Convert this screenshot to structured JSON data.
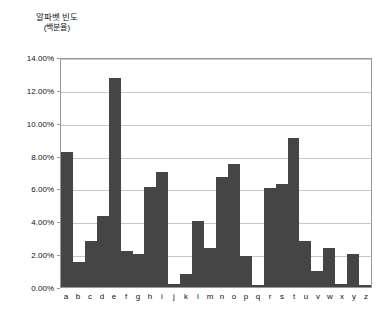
{
  "chart_data": {
    "type": "bar",
    "title": "알파벳 빈도",
    "subtitle": "(백분율)",
    "xlabel": "",
    "ylabel": "",
    "grid": true,
    "legend": "none",
    "ylim": [
      0,
      14
    ],
    "ytick_labels": [
      "14.00%",
      "12.00%",
      "10.00%",
      "8.00%",
      "6.00%",
      "4.00%",
      "2.00%",
      "0.00%"
    ],
    "ytick_values": [
      14,
      12,
      10,
      8,
      6,
      4,
      2,
      0
    ],
    "categories": [
      "a",
      "b",
      "c",
      "d",
      "e",
      "f",
      "g",
      "h",
      "i",
      "j",
      "k",
      "l",
      "m",
      "n",
      "o",
      "p",
      "q",
      "r",
      "s",
      "t",
      "u",
      "v",
      "w",
      "x",
      "y",
      "z"
    ],
    "values": [
      8.2,
      1.5,
      2.8,
      4.3,
      12.7,
      2.2,
      2.0,
      6.1,
      7.0,
      0.2,
      0.8,
      4.0,
      2.4,
      6.7,
      7.5,
      1.9,
      0.1,
      6.0,
      6.3,
      9.1,
      2.8,
      1.0,
      2.4,
      0.2,
      2.0,
      0.1
    ],
    "bar_color": "#454545",
    "plot_border_color": "#9a9a9a",
    "gridline_color": "#c8c8c8"
  }
}
